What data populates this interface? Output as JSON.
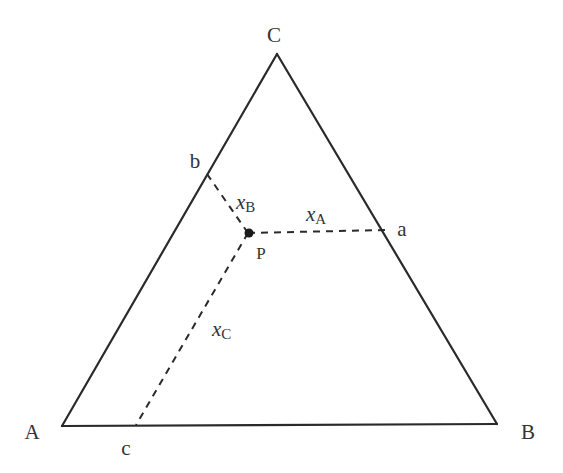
{
  "diagram": {
    "vertices": {
      "A": {
        "label": "A"
      },
      "B": {
        "label": "B"
      },
      "C": {
        "label": "C"
      }
    },
    "edge_points": {
      "a": {
        "label": "a"
      },
      "b": {
        "label": "b"
      },
      "c": {
        "label": "c"
      }
    },
    "point": {
      "label": "P"
    },
    "distances": {
      "xA": {
        "var": "x",
        "sub": "A"
      },
      "xB": {
        "var": "x",
        "sub": "B"
      },
      "xC": {
        "var": "x",
        "sub": "C"
      }
    }
  }
}
